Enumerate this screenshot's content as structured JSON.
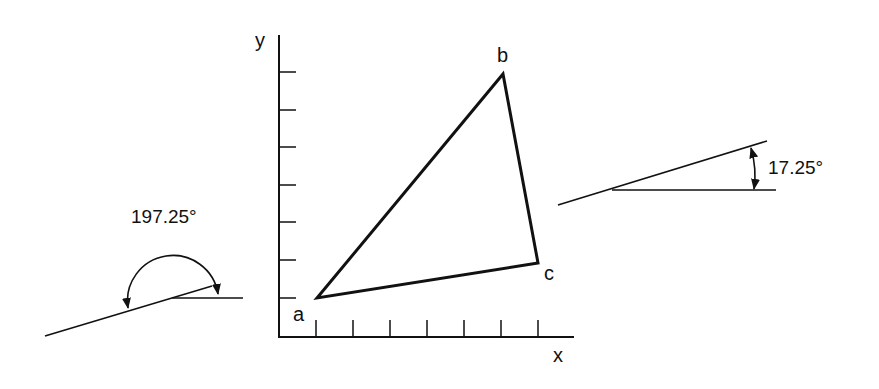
{
  "diagram": {
    "axes": {
      "x_label": "x",
      "y_label": "y",
      "tick_count_x": 7,
      "tick_count_y": 7
    },
    "triangle": {
      "vertices": [
        {
          "label": "a",
          "x": 1,
          "y": 1
        },
        {
          "label": "b",
          "x": 6,
          "y": 7
        },
        {
          "label": "c",
          "x": 7,
          "y": 2
        }
      ]
    },
    "angle_left": {
      "label": "197.25°",
      "description": "angle measured counterclockwise from horizontal, reflex"
    },
    "angle_right": {
      "label": "17.25°",
      "description": "angle between inclined line and horizontal"
    }
  },
  "colors": {
    "line": "#111111",
    "background": "#ffffff"
  }
}
